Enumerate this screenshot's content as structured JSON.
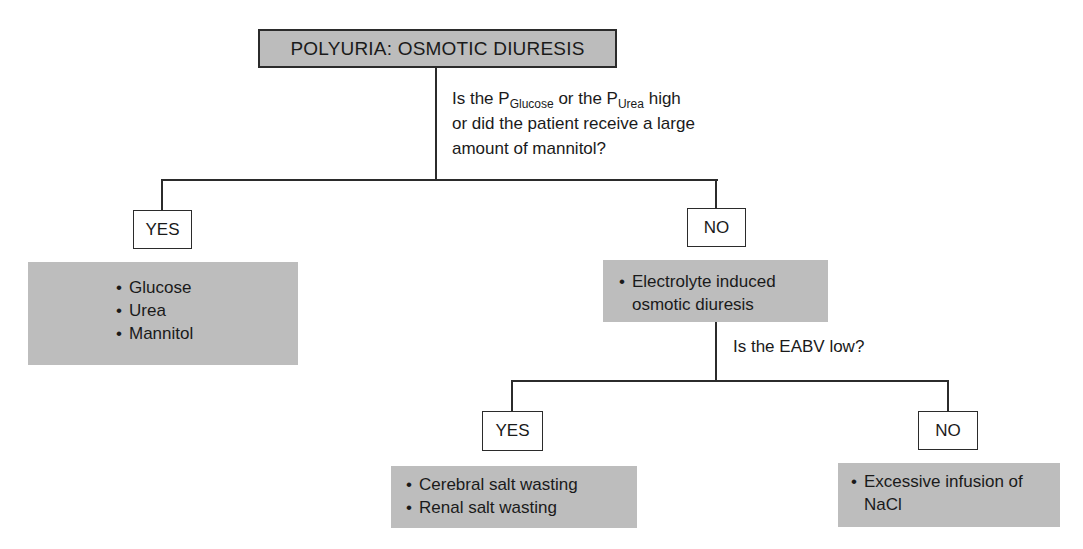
{
  "title": "POLYURIA: OSMOTIC DIURESIS",
  "question1": {
    "line1_prefix": "Is the P",
    "sub1": "Glucose",
    "line1_mid": " or the P",
    "sub2": "Urea",
    "line1_suffix": " high",
    "line2": "or did the patient receive a large",
    "line3": "amount of mannitol?"
  },
  "branch1": {
    "yes_label": "YES",
    "no_label": "NO",
    "yes_items": [
      "Glucose",
      "Urea",
      "Mannitol"
    ],
    "no_items": [
      "Electrolyte induced osmotic diuresis"
    ]
  },
  "question2": {
    "text": "Is the EABV low?"
  },
  "branch2": {
    "yes_label": "YES",
    "no_label": "NO",
    "yes_items": [
      "Cerebral salt wasting",
      "Renal salt wasting"
    ],
    "no_items": [
      "Excessive infusion of NaCl"
    ]
  },
  "colors": {
    "box_gray": "#bdbdbd",
    "line": "#2b2b2b",
    "background": "#ffffff"
  }
}
